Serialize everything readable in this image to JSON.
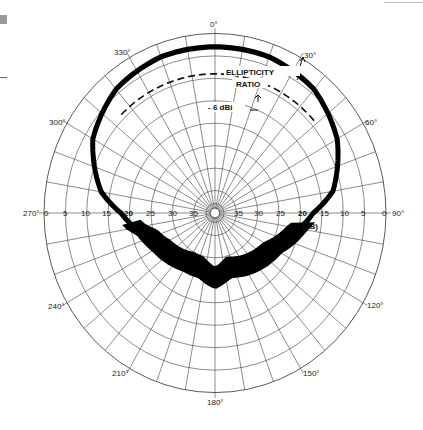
{
  "chart_data": {
    "type": "polar",
    "title": "",
    "angle_labels": [
      "0°",
      "30°",
      "60°",
      "90°",
      "120°",
      "150°",
      "180°",
      "210°",
      "240°",
      "270°",
      "300°",
      "330°"
    ],
    "radial_tick_labels": [
      "0",
      "5",
      "10",
      "15",
      "20",
      "25",
      "30",
      "35"
    ],
    "radial_unit": "(dB)",
    "radial_axis": {
      "outer": 0,
      "inner": 40,
      "step_db": 5,
      "direction": "decreasing toward center"
    },
    "angular_grid_step_deg": 10,
    "annotations": [
      {
        "text": "ELLIPTICITY",
        "near_angle_deg": 15
      },
      {
        "text": "RATIO",
        "near_angle_deg": 15
      },
      {
        "text": "- 6 dBi",
        "near_angle_deg": 10,
        "style": "dashed reference circle"
      }
    ],
    "series": [
      {
        "name": "Radiation pattern (ellipticity band)",
        "style": "thick filled trace",
        "angles_deg": [
          0,
          20,
          40,
          60,
          80,
          90,
          100,
          110,
          120,
          135,
          150,
          165,
          180,
          195,
          210,
          225,
          240,
          255,
          260,
          270,
          280,
          300,
          320,
          340
        ],
        "level_db": [
          -3,
          -3,
          -4,
          -7,
          -12,
          -17,
          -20,
          -22,
          -24,
          -25,
          -26,
          -27,
          -25,
          -27,
          -27,
          -26,
          -25,
          -23,
          -21,
          -18,
          -13,
          -7,
          -4,
          -3
        ]
      },
      {
        "name": "-6 dBi reference",
        "style": "dashed",
        "angles_deg": [
          -45,
          50
        ],
        "level_db": [
          -6,
          -6
        ]
      }
    ],
    "grid": true
  },
  "labels": {
    "a0": "0°",
    "a30": "30°",
    "a60": "60°",
    "a90": "90°",
    "a120": "120°",
    "a150": "150°",
    "a180": "180°",
    "a210": "210°",
    "a240": "240°",
    "a270": "270°",
    "a300": "300°",
    "a330": "330°",
    "ellipticity": "ELLIPTICITY",
    "ratio": "RATIO",
    "dbi": "- 6 dBi",
    "unit": "(dB)",
    "r0": "0",
    "r5": "5",
    "r10": "10",
    "r15": "15",
    "r20": "20",
    "r25": "25",
    "r30": "30",
    "r35": "35"
  }
}
